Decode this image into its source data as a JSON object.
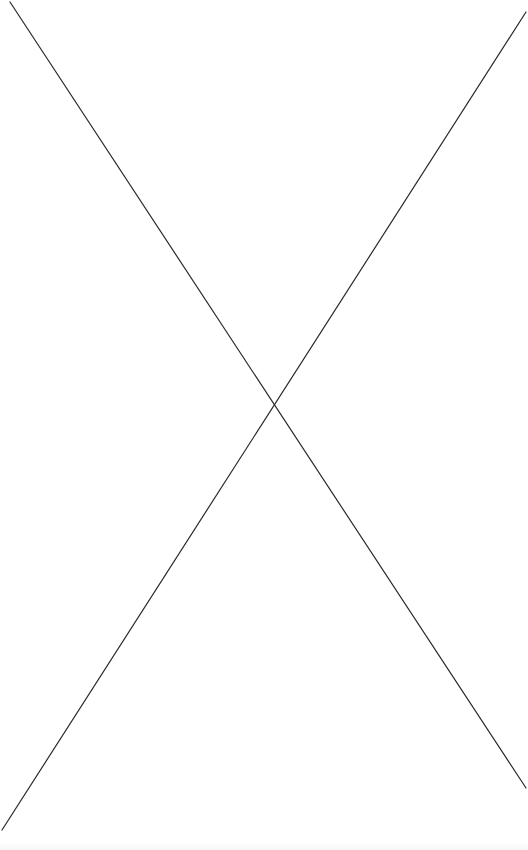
{
  "canvas": {
    "width": 528,
    "height": 850,
    "background": "#ffffff",
    "line_color": "#2a2a2a",
    "line_width": 1.2
  },
  "placeholder": {
    "lines": [
      {
        "x1": 10,
        "y1": 2,
        "x2": 526,
        "y2": 788
      },
      {
        "x1": 526,
        "y1": 12,
        "x2": 2,
        "y2": 830
      }
    ]
  }
}
